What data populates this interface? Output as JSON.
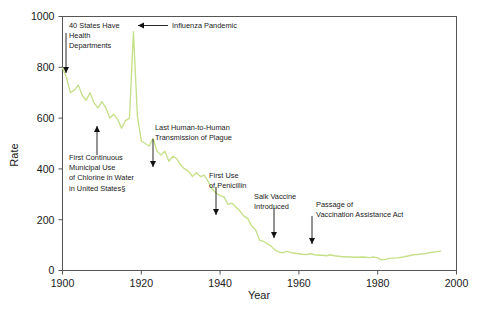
{
  "chart_data": {
    "type": "line",
    "title": "",
    "xlabel": "Year",
    "ylabel": "Rate",
    "xlim": [
      1900,
      2000
    ],
    "ylim": [
      0,
      1000
    ],
    "xticks": [
      "1900",
      "1920",
      "1940",
      "1960",
      "1980",
      "2000"
    ],
    "yticks": [
      "0",
      "200",
      "400",
      "600",
      "800",
      "1000"
    ],
    "xtick_values": [
      1900,
      1920,
      1940,
      1960,
      1980,
      2000
    ],
    "ytick_values": [
      0,
      200,
      400,
      600,
      800,
      1000
    ],
    "grid": false,
    "legend": "none",
    "series_color": "#c6e08a",
    "series": [
      {
        "name": "Crude death rate for infectious diseases",
        "x": [
          1900,
          1901,
          1902,
          1903,
          1904,
          1905,
          1906,
          1907,
          1908,
          1909,
          1910,
          1911,
          1912,
          1913,
          1914,
          1915,
          1916,
          1917,
          1918,
          1919,
          1920,
          1921,
          1922,
          1923,
          1924,
          1925,
          1926,
          1927,
          1928,
          1929,
          1930,
          1931,
          1932,
          1933,
          1934,
          1935,
          1936,
          1937,
          1938,
          1939,
          1940,
          1941,
          1942,
          1943,
          1944,
          1945,
          1946,
          1947,
          1948,
          1949,
          1950,
          1951,
          1952,
          1953,
          1954,
          1955,
          1956,
          1957,
          1958,
          1959,
          1960,
          1961,
          1962,
          1963,
          1964,
          1965,
          1966,
          1967,
          1968,
          1969,
          1970,
          1971,
          1972,
          1973,
          1974,
          1975,
          1976,
          1977,
          1978,
          1979,
          1980,
          1981,
          1982,
          1983,
          1984,
          1985,
          1986,
          1987,
          1988,
          1989,
          1990,
          1991,
          1992,
          1993,
          1994,
          1995,
          1996
        ],
        "y": [
          797,
          760,
          700,
          710,
          730,
          690,
          670,
          700,
          660,
          640,
          665,
          640,
          600,
          615,
          595,
          560,
          590,
          600,
          940,
          610,
          510,
          500,
          490,
          520,
          470,
          455,
          470,
          430,
          450,
          440,
          415,
          400,
          390,
          370,
          385,
          370,
          375,
          350,
          320,
          305,
          295,
          290,
          260,
          265,
          250,
          235,
          215,
          205,
          175,
          160,
          120,
          115,
          105,
          95,
          80,
          72,
          70,
          75,
          70,
          68,
          66,
          64,
          63,
          66,
          62,
          60,
          60,
          58,
          62,
          58,
          56,
          54,
          54,
          53,
          52,
          52,
          53,
          52,
          51,
          53,
          50,
          42,
          44,
          48,
          49,
          50,
          52,
          55,
          58,
          62,
          63,
          65,
          66,
          70,
          72,
          74,
          76
        ]
      }
    ],
    "annotations": [
      {
        "id": "health-departments",
        "label": "40 States Have\nHealth\nDepartments",
        "lines": [
          "40 States Have",
          "Health",
          "Departments"
        ],
        "point_year": 1900,
        "point_rate": 797,
        "direction": "down"
      },
      {
        "id": "influenza-pandemic",
        "label": "Influenza Pandemic",
        "lines": [
          "Influenza Pandemic"
        ],
        "point_year": 1918,
        "point_rate": 940,
        "direction": "left"
      },
      {
        "id": "chlorine-water",
        "label": "First Continuous\nMunicipal Use\nof Chlorine in Water\nin United States§",
        "lines": [
          "First Continuous",
          "Municipal Use",
          "of Chlorine in Water",
          "in United States§"
        ],
        "point_year": 1908,
        "point_rate": 660,
        "direction": "up"
      },
      {
        "id": "plague-transmission",
        "label": "Last Human-to-Human\nTransmission of Plague",
        "lines": [
          "Last Human-to-Human",
          "Transmission of Plague"
        ],
        "point_year": 1925,
        "point_rate": 455,
        "direction": "down"
      },
      {
        "id": "penicillin",
        "label": "First Use\nof Penicillin",
        "lines": [
          "First Use",
          "of Penicillin"
        ],
        "point_year": 1943,
        "point_rate": 265,
        "direction": "down"
      },
      {
        "id": "salk-vaccine",
        "label": "Salk Vaccine\nIntroduced",
        "lines": [
          "Salk Vaccine",
          "Introduced"
        ],
        "point_year": 1955,
        "point_rate": 72,
        "direction": "down"
      },
      {
        "id": "vaccination-assistance-act",
        "label": "Passage of\nVaccination Assistance Act",
        "lines": [
          "Passage of",
          "Vaccination Assistance Act"
        ],
        "point_year": 1963,
        "point_rate": 66,
        "direction": "down"
      }
    ]
  },
  "footnote": {
    "text": ""
  }
}
